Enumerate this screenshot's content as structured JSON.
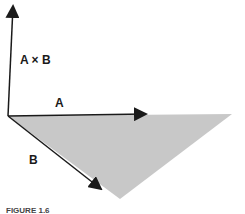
{
  "figure": {
    "labels": {
      "cross_product": "A × B",
      "vector_a": "A",
      "vector_b": "B"
    },
    "colors": {
      "parallelogram_fill": "#c8c8c8",
      "vector_stroke": "#1a1a1a",
      "background": "#ffffff"
    },
    "caption_visible_fragment": "FIGURE 1.6"
  }
}
